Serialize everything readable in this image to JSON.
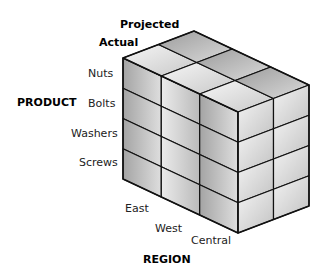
{
  "diagram": {
    "type": "olap-data-cube",
    "axes": {
      "product": {
        "title": "PRODUCT",
        "members": [
          "Nuts",
          "Bolts",
          "Washers",
          "Screws"
        ]
      },
      "region": {
        "title": "REGION",
        "members": [
          "East",
          "West",
          "Central"
        ]
      },
      "scenario": {
        "members": [
          "Actual",
          "Projected"
        ]
      }
    },
    "colors": {
      "edge": "#111111",
      "top_light_a": "#f4f4f4",
      "top_light_b": "#c9c9c9",
      "top_dark_a": "#9a9a9a",
      "top_dark_b": "#d6d6d6",
      "front_dark_a": "#a8a8a8",
      "front_dark_b": "#dcdcdc",
      "front_light_a": "#e6e6e6",
      "front_light_b": "#bcbcbc",
      "side_a": "#f2f2f2",
      "side_b": "#c4c4c4"
    }
  }
}
